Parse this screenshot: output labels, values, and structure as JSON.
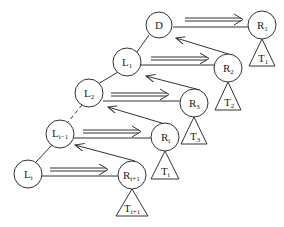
{
  "diagram": {
    "nodes": [
      {
        "id": "D",
        "base": "D",
        "sub": "",
        "x": 159,
        "y": 25
      },
      {
        "id": "R1",
        "base": "R",
        "sub": "1",
        "x": 262,
        "y": 25
      },
      {
        "id": "L1",
        "base": "L",
        "sub": "1",
        "x": 127,
        "y": 62
      },
      {
        "id": "R2",
        "base": "R",
        "sub": "2",
        "x": 228,
        "y": 68
      },
      {
        "id": "L2",
        "base": "L",
        "sub": "2",
        "x": 89,
        "y": 93
      },
      {
        "id": "R3",
        "base": "R",
        "sub": "3",
        "x": 194,
        "y": 103
      },
      {
        "id": "Li-1",
        "base": "L",
        "sub": "i−1",
        "x": 60,
        "y": 134
      },
      {
        "id": "Ri",
        "base": "R",
        "sub": "i",
        "x": 165,
        "y": 137
      },
      {
        "id": "Li",
        "base": "L",
        "sub": "i",
        "x": 28,
        "y": 174
      },
      {
        "id": "Ri+1",
        "base": "R",
        "sub": "i+1",
        "x": 132,
        "y": 175
      }
    ],
    "subtrees": [
      {
        "id": "T1",
        "base": "T",
        "sub": "1",
        "x": 262,
        "y": 39
      },
      {
        "id": "T2",
        "base": "T",
        "sub": "2",
        "x": 228,
        "y": 82
      },
      {
        "id": "T3",
        "base": "T",
        "sub": "3",
        "x": 194,
        "y": 117
      },
      {
        "id": "Ti",
        "base": "T",
        "sub": "i",
        "x": 165,
        "y": 151
      },
      {
        "id": "Ti+1",
        "base": "T",
        "sub": "i+1",
        "x": 132,
        "y": 189
      }
    ]
  }
}
